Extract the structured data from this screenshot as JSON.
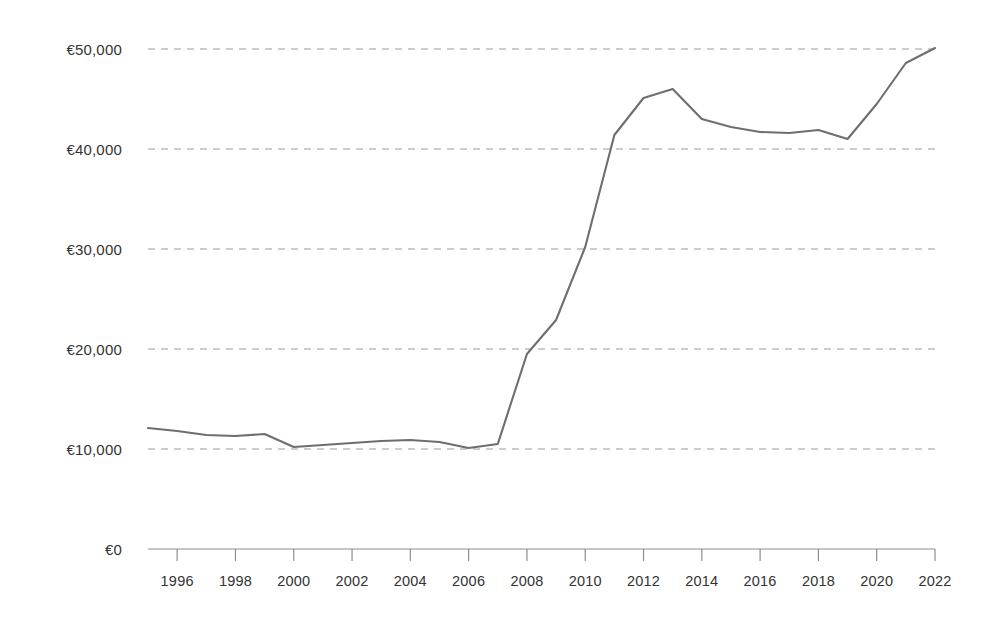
{
  "chart_data": {
    "type": "line",
    "title": "",
    "subtitle": "",
    "xlabel": "",
    "ylabel": "",
    "xlim": [
      1995,
      2022
    ],
    "ylim": [
      0,
      50000
    ],
    "grid": true,
    "legend": false,
    "legend_position": "none",
    "currency_symbol": "€",
    "line_color": "#6e6e6e",
    "gridline_color": "#9a9a9a",
    "axis_color": "#8d8d8d",
    "text_color": "#333333",
    "background_color": "#ffffff",
    "y_ticks": [
      0,
      10000,
      20000,
      30000,
      40000,
      50000
    ],
    "y_tick_labels": [
      "€0",
      "€10,000",
      "€20,000",
      "€30,000",
      "€40,000",
      "€50,000"
    ],
    "x_ticks": [
      1996,
      1998,
      2000,
      2002,
      2004,
      2006,
      2008,
      2010,
      2012,
      2014,
      2016,
      2018,
      2020,
      2022
    ],
    "x_tick_labels": [
      "1996",
      "1998",
      "2000",
      "2002",
      "2004",
      "2006",
      "2008",
      "2010",
      "2012",
      "2014",
      "2016",
      "2018",
      "2020",
      "2022"
    ],
    "x": [
      1995,
      1996,
      1997,
      1998,
      1999,
      2000,
      2001,
      2002,
      2003,
      2004,
      2005,
      2006,
      2007,
      2008,
      2009,
      2010,
      2011,
      2012,
      2013,
      2014,
      2015,
      2016,
      2017,
      2018,
      2019,
      2020,
      2021,
      2022
    ],
    "values": [
      12100,
      11800,
      11400,
      11300,
      11500,
      10200,
      10400,
      10600,
      10800,
      10900,
      10700,
      10100,
      10500,
      19500,
      22900,
      30200,
      41400,
      45100,
      46000,
      43000,
      42200,
      41700,
      41600,
      41900,
      41000,
      44500,
      48600,
      50100
    ],
    "series": [
      {
        "name": "Value",
        "values": [
          12100,
          11800,
          11400,
          11300,
          11500,
          10200,
          10400,
          10600,
          10800,
          10900,
          10700,
          10100,
          10500,
          19500,
          22900,
          30200,
          41400,
          45100,
          46000,
          43000,
          42200,
          41700,
          41600,
          41900,
          41000,
          44500,
          48600,
          50100
        ]
      }
    ]
  }
}
